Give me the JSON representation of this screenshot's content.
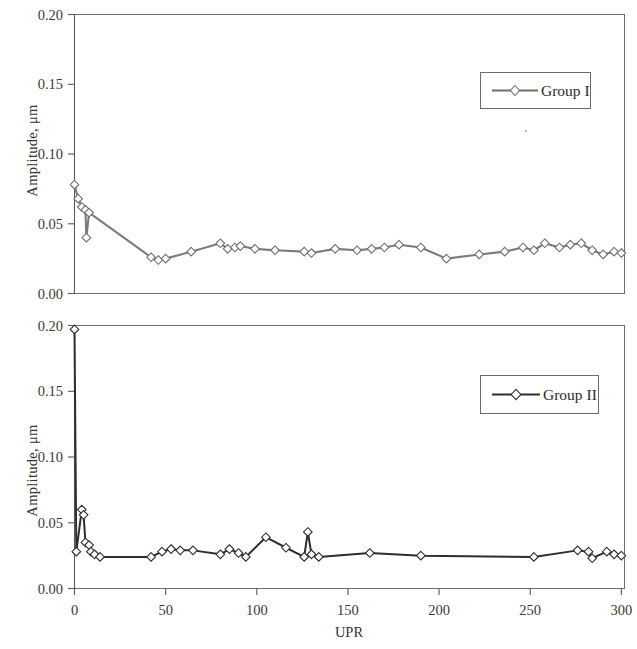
{
  "figure": {
    "background_color": "#ffffff",
    "panel_count": 2
  },
  "chart_data": [
    {
      "type": "line",
      "title": "",
      "subtitle": "",
      "xlabel": "",
      "ylabel": "Amplitude,  μm",
      "legend": [
        "Group I"
      ],
      "legend_position": "top-right inside plot",
      "grid": false,
      "marker": "open-diamond",
      "line_color": "#7b7b7b",
      "xlim": [
        0,
        302
      ],
      "ylim": [
        0.0,
        0.2
      ],
      "xticks": [
        0,
        50,
        100,
        150,
        200,
        250,
        300
      ],
      "xticklabels": [
        "0",
        "50",
        "100",
        "150",
        "200",
        "250",
        "300"
      ],
      "yticks": [
        0.0,
        0.05,
        0.1,
        0.15,
        0.2
      ],
      "yticklabels": [
        "0.00",
        "0.05",
        "0.10",
        "0.15",
        "0.20"
      ],
      "series": [
        {
          "name": "Group I",
          "x": [
            0,
            2,
            4,
            6,
            6.5,
            8,
            42,
            46,
            50,
            64,
            80,
            84,
            88,
            91,
            99,
            110,
            126,
            130,
            143,
            155,
            163,
            170,
            178,
            190,
            204,
            222,
            236,
            246,
            252,
            258,
            266,
            272,
            278,
            284,
            290,
            296,
            300
          ],
          "y": [
            0.078,
            0.068,
            0.062,
            0.06,
            0.04,
            0.058,
            0.026,
            0.024,
            0.025,
            0.03,
            0.036,
            0.032,
            0.033,
            0.034,
            0.032,
            0.031,
            0.03,
            0.029,
            0.032,
            0.031,
            0.032,
            0.033,
            0.035,
            0.033,
            0.025,
            0.028,
            0.03,
            0.033,
            0.031,
            0.036,
            0.033,
            0.035,
            0.036,
            0.031,
            0.028,
            0.03,
            0.029
          ]
        }
      ]
    },
    {
      "type": "line",
      "title": "",
      "subtitle": "",
      "xlabel": "UPR",
      "ylabel": "Amplitude,  μm",
      "legend": [
        "Group II"
      ],
      "legend_position": "upper-right inside plot",
      "grid": false,
      "marker": "open-diamond",
      "line_color": "#2e2e2e",
      "xlim": [
        0,
        302
      ],
      "ylim": [
        0.0,
        0.2
      ],
      "xticks": [
        0,
        50,
        100,
        150,
        200,
        250,
        300
      ],
      "xticklabels": [
        "0",
        "50",
        "100",
        "150",
        "200",
        "250",
        "300"
      ],
      "yticks": [
        0.0,
        0.05,
        0.1,
        0.15,
        0.2
      ],
      "yticklabels": [
        "0.00",
        "0.05",
        "0.10",
        "0.15",
        "0.20"
      ],
      "series": [
        {
          "name": "Group II",
          "x": [
            0,
            1,
            4,
            5,
            6,
            8,
            9,
            11,
            14,
            42,
            48,
            53,
            58,
            65,
            80,
            85,
            90,
            94,
            105,
            116,
            126,
            128,
            130,
            134,
            162,
            190,
            252,
            276,
            282,
            284,
            292,
            296,
            300
          ],
          "y": [
            0.197,
            0.028,
            0.06,
            0.056,
            0.035,
            0.033,
            0.028,
            0.026,
            0.024,
            0.024,
            0.028,
            0.03,
            0.029,
            0.029,
            0.026,
            0.03,
            0.027,
            0.024,
            0.039,
            0.031,
            0.024,
            0.043,
            0.026,
            0.024,
            0.027,
            0.025,
            0.024,
            0.029,
            0.028,
            0.023,
            0.028,
            0.026,
            0.025
          ]
        }
      ]
    }
  ]
}
